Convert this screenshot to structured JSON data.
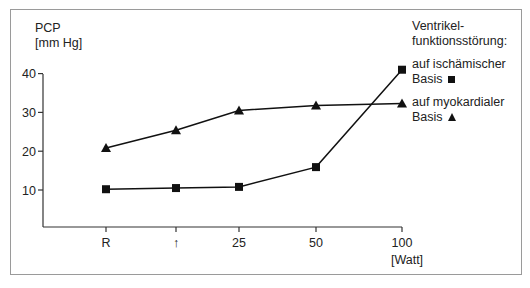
{
  "chart_data": {
    "type": "line",
    "title": "",
    "ylabel": "PCP [mm Hg]",
    "ylabel_lines": [
      "PCP",
      "[mm Hg]"
    ],
    "xlabel": "[Watt]",
    "categories": [
      "R",
      "↑",
      "25",
      "50",
      "100"
    ],
    "yticks": [
      10,
      20,
      30,
      40
    ],
    "ylim": [
      0,
      40
    ],
    "grid": false,
    "legend_position": "right",
    "legend_title": [
      "Ventrikel-",
      "funktionsstörung:"
    ],
    "series": [
      {
        "name": "auf ischämischer Basis",
        "label_lines": [
          "auf ischämischer",
          "Basis"
        ],
        "marker": "square",
        "values": [
          10.2,
          10.5,
          10.8,
          15.9,
          41
        ]
      },
      {
        "name": "auf myokardialer Basis",
        "label_lines": [
          "auf myokardialer",
          "Basis"
        ],
        "marker": "triangle",
        "values": [
          20.8,
          25.4,
          30.5,
          31.8,
          32.3
        ]
      }
    ]
  },
  "colors": {
    "line": "#111111",
    "frame": "#9a9a9a",
    "text": "#222222"
  }
}
